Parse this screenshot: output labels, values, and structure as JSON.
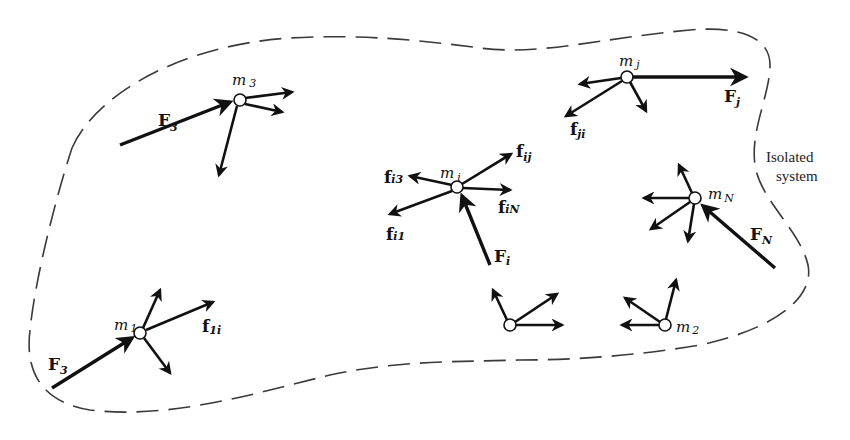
{
  "diagram": {
    "boundary_label": {
      "line1": "Isolated",
      "line2": "system"
    },
    "particles": [
      {
        "id": "m3",
        "mass_label": "m",
        "mass_sub": "3",
        "external_force": {
          "label": "F",
          "sub": "3"
        }
      },
      {
        "id": "mi",
        "mass_label": "m",
        "mass_sub": "i",
        "external_force": {
          "label": "F",
          "sub": "i"
        },
        "internal_forces": [
          {
            "label": "f",
            "sub": "ij"
          },
          {
            "label": "f",
            "sub": "i3"
          },
          {
            "label": "f",
            "sub": "iN"
          },
          {
            "label": "f",
            "sub": "i1"
          }
        ]
      },
      {
        "id": "mj",
        "mass_label": "m",
        "mass_sub": "j",
        "external_force": {
          "label": "F",
          "sub": "j"
        },
        "internal_forces": [
          {
            "label": "f",
            "sub": "ji"
          }
        ]
      },
      {
        "id": "mN",
        "mass_label": "m",
        "mass_sub": "N",
        "external_force": {
          "label": "F",
          "sub": "N"
        }
      },
      {
        "id": "m1",
        "mass_label": "m",
        "mass_sub": "1",
        "external_force": {
          "label": "F",
          "sub": "3"
        },
        "internal_forces": [
          {
            "label": "f",
            "sub": "1i"
          }
        ]
      },
      {
        "id": "unlabeled",
        "mass_label": "",
        "mass_sub": ""
      },
      {
        "id": "m2",
        "mass_label": "m",
        "mass_sub": "2"
      }
    ]
  }
}
